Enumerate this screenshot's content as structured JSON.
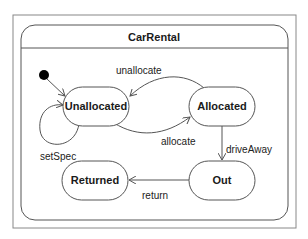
{
  "diagram": {
    "type": "UML state machine",
    "composite_state": {
      "name": "CarRental"
    },
    "colors": {
      "stroke": "#555555",
      "text": "#1a1a1a",
      "background": "#ffffff",
      "initial": "#000000"
    },
    "states": [
      {
        "id": "unallocated",
        "label": "Unallocated"
      },
      {
        "id": "allocated",
        "label": "Allocated"
      },
      {
        "id": "returned",
        "label": "Returned"
      },
      {
        "id": "out",
        "label": "Out"
      }
    ],
    "transitions": [
      {
        "from": "initial",
        "to": "unallocated",
        "label": ""
      },
      {
        "from": "allocated",
        "to": "unallocated",
        "label": "unallocate"
      },
      {
        "from": "unallocated",
        "to": "allocated",
        "label": "allocate"
      },
      {
        "from": "unallocated",
        "to": "unallocated",
        "label": "setSpec"
      },
      {
        "from": "allocated",
        "to": "out",
        "label": "driveAway"
      },
      {
        "from": "out",
        "to": "returned",
        "label": "return"
      }
    ]
  }
}
